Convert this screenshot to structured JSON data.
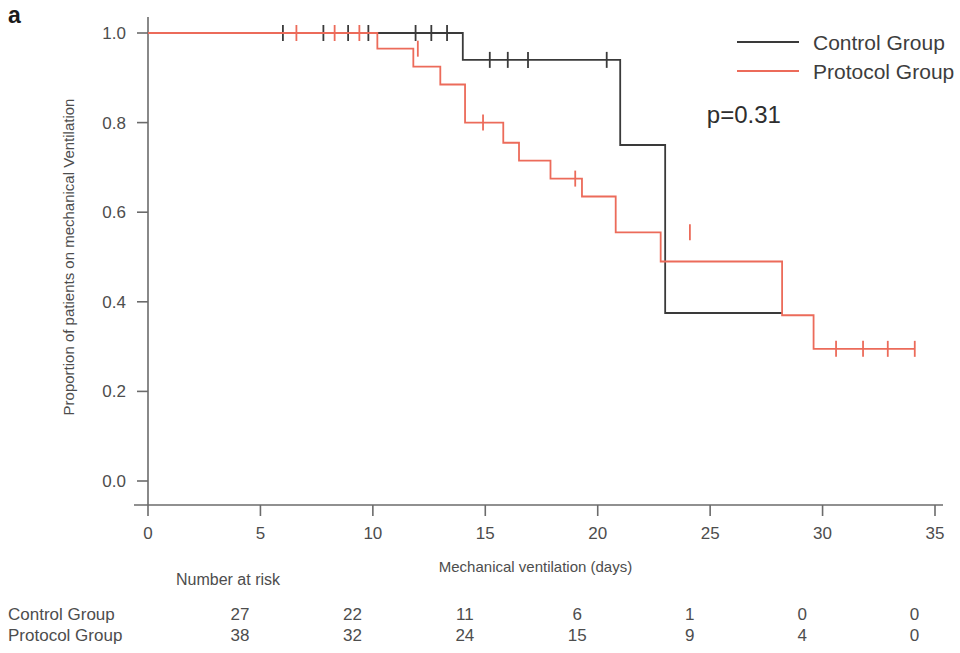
{
  "panel": {
    "label": "a"
  },
  "annotation": {
    "pvalue": "p=0.31"
  },
  "legend": {
    "position": "top-right",
    "entries": [
      {
        "label": "Control Group",
        "color": "#3a3a3a"
      },
      {
        "label": "Protocol Group",
        "color": "#ec6b5a"
      }
    ]
  },
  "risk_table": {
    "title": "Number at risk",
    "times": [
      0,
      5,
      10,
      15,
      20,
      25,
      30,
      35
    ],
    "rows": [
      {
        "label": "Control Group",
        "counts": [
          27,
          22,
          11,
          6,
          1,
          0,
          0
        ]
      },
      {
        "label": "Protocol Group",
        "counts": [
          38,
          32,
          24,
          15,
          9,
          4,
          0
        ]
      }
    ]
  },
  "chart_data": {
    "type": "line",
    "subtype": "kaplan-meier-step",
    "title": "",
    "xlabel": "Mechanical ventilation (days)",
    "ylabel": "Proportion of patients on mechanical Ventilation",
    "xlim": [
      0,
      35
    ],
    "ylim": [
      0.0,
      1.0
    ],
    "xticks": [
      0,
      5,
      10,
      15,
      20,
      25,
      30,
      35
    ],
    "xtick_labels": [
      "0",
      "5",
      "10",
      "15",
      "20",
      "25",
      "30",
      "35"
    ],
    "yticks": [
      0.0,
      0.2,
      0.4,
      0.6,
      0.8,
      1.0
    ],
    "ytick_labels": [
      "0.0",
      "0.2",
      "0.4",
      "0.6",
      "0.8",
      "1.0"
    ],
    "grid": false,
    "legend_position": "top-right",
    "annotations": [
      {
        "text": "p=0.31",
        "x": 26.5,
        "y": 0.8
      }
    ],
    "series": [
      {
        "name": "Control Group",
        "color": "#3a3a3a",
        "steps": [
          {
            "x": 0,
            "y": 1.0
          },
          {
            "x": 14.0,
            "y": 1.0
          },
          {
            "x": 14.0,
            "y": 0.94
          },
          {
            "x": 21.0,
            "y": 0.94
          },
          {
            "x": 21.0,
            "y": 0.75
          },
          {
            "x": 23.0,
            "y": 0.75
          },
          {
            "x": 23.0,
            "y": 0.375
          },
          {
            "x": 28.2,
            "y": 0.375
          }
        ],
        "censor_marks": [
          {
            "x": 6.0,
            "y": 1.0
          },
          {
            "x": 7.8,
            "y": 1.0
          },
          {
            "x": 8.9,
            "y": 1.0
          },
          {
            "x": 9.8,
            "y": 1.0
          },
          {
            "x": 11.9,
            "y": 1.0
          },
          {
            "x": 12.6,
            "y": 1.0
          },
          {
            "x": 13.3,
            "y": 1.0
          },
          {
            "x": 15.2,
            "y": 0.94
          },
          {
            "x": 16.0,
            "y": 0.94
          },
          {
            "x": 16.9,
            "y": 0.94
          },
          {
            "x": 20.4,
            "y": 0.94
          }
        ]
      },
      {
        "name": "Protocol Group",
        "color": "#ec6b5a",
        "steps": [
          {
            "x": 0,
            "y": 1.0
          },
          {
            "x": 10.2,
            "y": 1.0
          },
          {
            "x": 10.2,
            "y": 0.965
          },
          {
            "x": 11.8,
            "y": 0.965
          },
          {
            "x": 11.8,
            "y": 0.925
          },
          {
            "x": 13.0,
            "y": 0.925
          },
          {
            "x": 13.0,
            "y": 0.885
          },
          {
            "x": 14.1,
            "y": 0.885
          },
          {
            "x": 14.1,
            "y": 0.8
          },
          {
            "x": 15.8,
            "y": 0.8
          },
          {
            "x": 15.8,
            "y": 0.755
          },
          {
            "x": 16.5,
            "y": 0.755
          },
          {
            "x": 16.5,
            "y": 0.715
          },
          {
            "x": 17.9,
            "y": 0.715
          },
          {
            "x": 17.9,
            "y": 0.675
          },
          {
            "x": 19.3,
            "y": 0.675
          },
          {
            "x": 19.3,
            "y": 0.635
          },
          {
            "x": 20.8,
            "y": 0.635
          },
          {
            "x": 20.8,
            "y": 0.555
          },
          {
            "x": 22.8,
            "y": 0.555
          },
          {
            "x": 22.8,
            "y": 0.49
          },
          {
            "x": 28.2,
            "y": 0.49
          },
          {
            "x": 28.2,
            "y": 0.37
          },
          {
            "x": 29.6,
            "y": 0.37
          },
          {
            "x": 29.6,
            "y": 0.295
          },
          {
            "x": 34.1,
            "y": 0.295
          }
        ],
        "censor_marks": [
          {
            "x": 6.6,
            "y": 1.0
          },
          {
            "x": 8.3,
            "y": 1.0
          },
          {
            "x": 9.4,
            "y": 1.0
          },
          {
            "x": 12.0,
            "y": 0.965
          },
          {
            "x": 14.9,
            "y": 0.8
          },
          {
            "x": 19.0,
            "y": 0.675
          },
          {
            "x": 24.1,
            "y": 0.555
          },
          {
            "x": 30.6,
            "y": 0.295
          },
          {
            "x": 31.8,
            "y": 0.295
          },
          {
            "x": 32.9,
            "y": 0.295
          },
          {
            "x": 34.1,
            "y": 0.295
          }
        ]
      }
    ]
  }
}
